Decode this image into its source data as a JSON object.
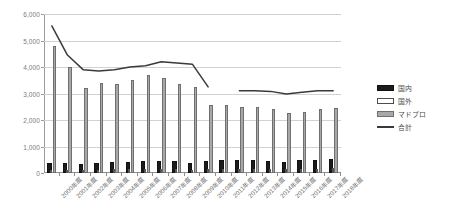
{
  "title": "",
  "legend": {
    "position": "right",
    "items": [
      {
        "label": "国内",
        "key": "kokunai",
        "color": "#1c1c1c"
      },
      {
        "label": "国外",
        "key": "kokugai",
        "color": "#ffffff"
      },
      {
        "label": "マドプロ",
        "key": "madopro",
        "color": "#a8a8a8"
      },
      {
        "label": "合計",
        "key": "goukei",
        "color": "#3a3a3a"
      }
    ]
  },
  "yaxis": {
    "ticks": [
      "6,000",
      "5,000",
      "4,000",
      "3,000",
      "2,000",
      "1,000",
      "0"
    ],
    "min": 0,
    "max": 6000,
    "step": 1000
  },
  "chart_data": {
    "type": "bar",
    "title": "",
    "xlabel": "",
    "ylabel": "",
    "ylim": [
      0,
      6000
    ],
    "grid": true,
    "legend_position": "right",
    "categories": [
      "2000年度",
      "2001年度",
      "2002年度",
      "2003年度",
      "2004年度",
      "2005年度",
      "2006年度",
      "2007年度",
      "2008年度",
      "2009年度",
      "2010年度",
      "2011年度",
      "2012年度",
      "2013年度",
      "2014年度",
      "2015年度",
      "2016年度",
      "2017年度",
      "2018年度"
    ],
    "series": [
      {
        "name": "国内",
        "type": "bar",
        "color": "#1c1c1c",
        "values": [
          300,
          300,
          250,
          320,
          330,
          330,
          360,
          380,
          360,
          300,
          390,
          400,
          400,
          400,
          380,
          350,
          400,
          430,
          470
        ]
      },
      {
        "name": "国外",
        "type": "bar",
        "color": "#ffffff",
        "values": [
          120,
          130,
          110,
          130,
          140,
          140,
          150,
          160,
          150,
          120,
          150,
          160,
          160,
          160,
          150,
          140,
          160,
          170,
          180
        ]
      },
      {
        "name": "マドプロ",
        "type": "bar",
        "color": "#a8a8a8",
        "values": [
          4800,
          4000,
          3200,
          3400,
          3350,
          3500,
          3700,
          3600,
          3350,
          3250,
          2550,
          2550,
          2500,
          2500,
          2400,
          2250,
          2300,
          2400,
          2450
        ]
      },
      {
        "name": "合計",
        "type": "line",
        "color": "#3a3a3a",
        "values": [
          5550,
          4450,
          3900,
          3850,
          3900,
          4000,
          4050,
          4200,
          4150,
          4100,
          3250,
          null,
          3100,
          3100,
          3080,
          2980,
          3050,
          3100,
          3100
        ]
      }
    ]
  }
}
